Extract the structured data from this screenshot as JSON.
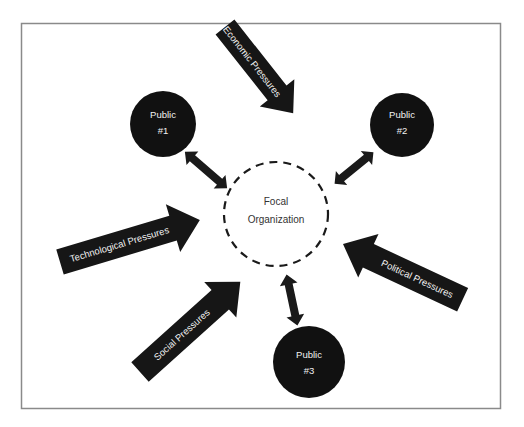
{
  "diagram": {
    "title": "",
    "colors": {
      "frame": "#8a8a8a",
      "node_fill": "#111111",
      "arrow_fill": "#161616",
      "text_on_dark": "#f2f2f2",
      "text_on_light": "#333333"
    },
    "focal": {
      "line1": "Focal",
      "line2": "Organization"
    },
    "publics": [
      {
        "line1": "Public",
        "line2": "#1"
      },
      {
        "line1": "Public",
        "line2": "#2"
      },
      {
        "line1": "Public",
        "line2": "#3"
      }
    ],
    "pressures": [
      {
        "label": "Economic Pressures"
      },
      {
        "label": "Technological Pressures"
      },
      {
        "label": "Political Pressures"
      },
      {
        "label": "Social Pressures"
      }
    ],
    "relationships": [
      {
        "from": "Public #1",
        "to": "Focal Organization",
        "type": "bidirectional"
      },
      {
        "from": "Public #2",
        "to": "Focal Organization",
        "type": "bidirectional"
      },
      {
        "from": "Public #3",
        "to": "Focal Organization",
        "type": "bidirectional"
      }
    ]
  }
}
